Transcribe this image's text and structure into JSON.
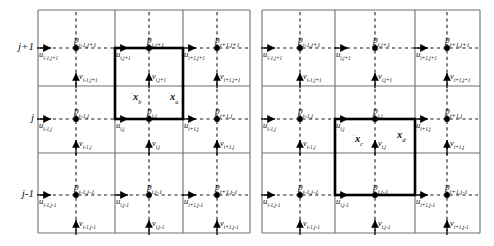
{
  "figure": {
    "type": "staggered-grid-diagram",
    "panel_count": 2
  },
  "row_labels": [
    {
      "id": "row-jp1",
      "text": "j+1",
      "y": 48
    },
    {
      "id": "row-j",
      "text": "j",
      "y": 119
    },
    {
      "id": "row-jm1",
      "text": "j-1",
      "y": 195
    }
  ],
  "panels": [
    {
      "id": "left",
      "name": "left-panel",
      "bounds": {
        "x": 38,
        "y": 10,
        "w": 212,
        "h": 223
      },
      "x_lines": [
        38,
        115,
        183,
        250
      ],
      "y_lines": [
        10,
        86,
        153,
        233
      ],
      "p_x": [
        76,
        149,
        217
      ],
      "p_y": [
        48,
        119,
        195
      ],
      "highlight": {
        "x": 115,
        "y": 48,
        "w": 68,
        "h": 71
      },
      "pressure_nodes": [
        {
          "label": "p",
          "sub": "i-1,j+1",
          "x": 76,
          "y": 48
        },
        {
          "label": "p",
          "sub": "i,j+1",
          "x": 149,
          "y": 48
        },
        {
          "label": "p",
          "sub": "i+1,j+1",
          "x": 217,
          "y": 48
        },
        {
          "label": "p",
          "sub": "i-1,j",
          "x": 76,
          "y": 119
        },
        {
          "label": "p",
          "sub": "i,j",
          "x": 149,
          "y": 119
        },
        {
          "label": "p",
          "sub": "i+1,j",
          "x": 217,
          "y": 119
        },
        {
          "label": "p",
          "sub": "i-1,j-1",
          "x": 76,
          "y": 195
        },
        {
          "label": "p",
          "sub": "i,j-1",
          "x": 149,
          "y": 195
        },
        {
          "label": "p",
          "sub": "i+1,j-1",
          "x": 217,
          "y": 195
        }
      ],
      "u_nodes": [
        {
          "label": "u",
          "sub": "i-1,j+1",
          "x": 38,
          "y": 48
        },
        {
          "label": "u",
          "sub": "i,j+1",
          "x": 115,
          "y": 48
        },
        {
          "label": "u",
          "sub": "i+1,j+1",
          "x": 183,
          "y": 48
        },
        {
          "label": "u",
          "sub": "i-1,j",
          "x": 38,
          "y": 119
        },
        {
          "label": "u",
          "sub": "i,j",
          "x": 115,
          "y": 119
        },
        {
          "label": "u",
          "sub": "i+1,j",
          "x": 183,
          "y": 119
        },
        {
          "label": "u",
          "sub": "i-1,j-1",
          "x": 38,
          "y": 195
        },
        {
          "label": "u",
          "sub": "i,j-1",
          "x": 115,
          "y": 195
        },
        {
          "label": "u",
          "sub": "i+1,j-1",
          "x": 183,
          "y": 195
        }
      ],
      "v_nodes": [
        {
          "label": "v",
          "sub": "i-1,j+1",
          "x": 76,
          "y": 86
        },
        {
          "label": "v",
          "sub": "i,j+1",
          "x": 149,
          "y": 86
        },
        {
          "label": "v",
          "sub": "i+1,j+1",
          "x": 217,
          "y": 86
        },
        {
          "label": "v",
          "sub": "i-1,j",
          "x": 76,
          "y": 153
        },
        {
          "label": "v",
          "sub": "i,j",
          "x": 149,
          "y": 153
        },
        {
          "label": "v",
          "sub": "i+1,j",
          "x": 217,
          "y": 153
        },
        {
          "label": "v",
          "sub": "i-1,j-1",
          "x": 76,
          "y": 233
        },
        {
          "label": "v",
          "sub": "i,j-1",
          "x": 149,
          "y": 233
        },
        {
          "label": "v",
          "sub": "i+1,j-1",
          "x": 217,
          "y": 233
        }
      ],
      "particles": [
        {
          "label": "x",
          "sub": "b",
          "x": 131,
          "y": 100,
          "dot": "left"
        },
        {
          "label": "x",
          "sub": "a",
          "x": 168,
          "y": 100,
          "dot": "left"
        }
      ]
    },
    {
      "id": "right",
      "name": "right-panel",
      "bounds": {
        "x": 262,
        "y": 10,
        "w": 218,
        "h": 223
      },
      "x_lines": [
        262,
        335,
        415,
        480
      ],
      "y_lines": [
        10,
        86,
        153,
        233
      ],
      "p_x": [
        300,
        375,
        447
      ],
      "p_y": [
        48,
        119,
        195
      ],
      "highlight": {
        "x": 335,
        "y": 119,
        "w": 80,
        "h": 76
      },
      "pressure_nodes": [
        {
          "label": "p",
          "sub": "i-1,j+1",
          "x": 300,
          "y": 48
        },
        {
          "label": "p",
          "sub": "i,j+1",
          "x": 375,
          "y": 48
        },
        {
          "label": "p",
          "sub": "i+1,j+1",
          "x": 447,
          "y": 48
        },
        {
          "label": "p",
          "sub": "i-1,j",
          "x": 300,
          "y": 119
        },
        {
          "label": "p",
          "sub": "i,j",
          "x": 375,
          "y": 119
        },
        {
          "label": "p",
          "sub": "i+1,j",
          "x": 447,
          "y": 119
        },
        {
          "label": "p",
          "sub": "i-1,j-1",
          "x": 300,
          "y": 195
        },
        {
          "label": "p",
          "sub": "i,j-1",
          "x": 375,
          "y": 195
        },
        {
          "label": "p",
          "sub": "i+1,j-1",
          "x": 447,
          "y": 195
        }
      ],
      "u_nodes": [
        {
          "label": "u",
          "sub": "i-1,j+1",
          "x": 262,
          "y": 48
        },
        {
          "label": "u",
          "sub": "i,j+1",
          "x": 335,
          "y": 48
        },
        {
          "label": "u",
          "sub": "i+1,j+1",
          "x": 415,
          "y": 48
        },
        {
          "label": "u",
          "sub": "i-1,j",
          "x": 262,
          "y": 119
        },
        {
          "label": "u",
          "sub": "i,j",
          "x": 335,
          "y": 119
        },
        {
          "label": "u",
          "sub": "i+1,j",
          "x": 415,
          "y": 119
        },
        {
          "label": "u",
          "sub": "i-1,j-1",
          "x": 262,
          "y": 195
        },
        {
          "label": "u",
          "sub": "i,j-1",
          "x": 335,
          "y": 195
        },
        {
          "label": "u",
          "sub": "i+1,j-1",
          "x": 415,
          "y": 195
        }
      ],
      "v_nodes": [
        {
          "label": "v",
          "sub": "i-1,j+1",
          "x": 300,
          "y": 86
        },
        {
          "label": "v",
          "sub": "i,j+1",
          "x": 375,
          "y": 86
        },
        {
          "label": "v",
          "sub": "i+1,j+1",
          "x": 447,
          "y": 86
        },
        {
          "label": "v",
          "sub": "i-1,j",
          "x": 300,
          "y": 153
        },
        {
          "label": "v",
          "sub": "i,j",
          "x": 375,
          "y": 153
        },
        {
          "label": "v",
          "sub": "i+1,j",
          "x": 447,
          "y": 153
        },
        {
          "label": "v",
          "sub": "i-1,j-1",
          "x": 300,
          "y": 233
        },
        {
          "label": "v",
          "sub": "i,j-1",
          "x": 375,
          "y": 233
        },
        {
          "label": "v",
          "sub": "i+1,j-1",
          "x": 447,
          "y": 233
        }
      ],
      "particles": [
        {
          "label": "x",
          "sub": "c",
          "x": 353,
          "y": 142,
          "dot": "left"
        },
        {
          "label": "x",
          "sub": "d",
          "x": 395,
          "y": 138,
          "dot": "right"
        }
      ]
    }
  ],
  "colors": {
    "grid": "#6e6e6e",
    "dashed": "#1a1a1a",
    "highlight": "#000000",
    "text": "#111111",
    "node": "#000000"
  }
}
